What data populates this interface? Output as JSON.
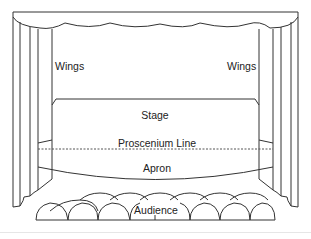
{
  "diagram": {
    "type": "theater-stage-plan",
    "labels": {
      "wings_left": "Wings",
      "wings_right": "Wings",
      "stage": "Stage",
      "proscenium_line": "Proscenium Line",
      "apron": "Apron",
      "audience": "Audience"
    },
    "colors": {
      "stroke": "#333333",
      "text": "#222222",
      "background": "#ffffff"
    }
  }
}
